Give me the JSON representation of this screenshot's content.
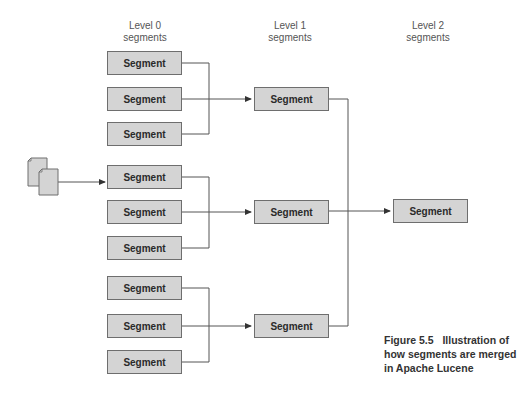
{
  "levels": [
    {
      "label_line1": "Level 0",
      "label_line2": "segments"
    },
    {
      "label_line1": "Level 1",
      "label_line2": "segments"
    },
    {
      "label_line1": "Level 2",
      "label_line2": "segments"
    }
  ],
  "segment_label": "Segment",
  "level0_segments": [
    "Segment",
    "Segment",
    "Segment",
    "Segment",
    "Segment",
    "Segment",
    "Segment",
    "Segment",
    "Segment"
  ],
  "level1_segments": [
    "Segment",
    "Segment",
    "Segment"
  ],
  "level2_segments": [
    "Segment"
  ],
  "icons": {
    "documents": "documents-icon"
  },
  "caption": {
    "figure": "Figure 5.5",
    "line1": "Illustration of",
    "line2": "how segments are merged",
    "line3": "in Apache Lucene"
  },
  "colors": {
    "box_fill": "#d4d4d4",
    "box_border": "#6e6e6e",
    "line": "#555555"
  }
}
